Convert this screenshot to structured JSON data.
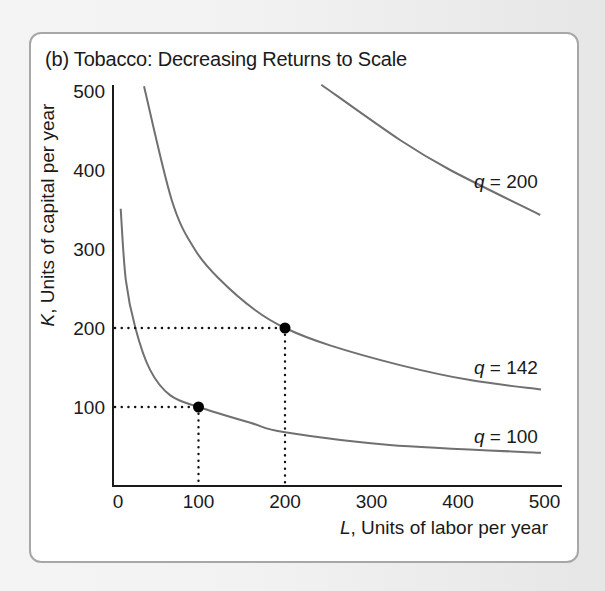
{
  "title": "(b) Tobacco: Decreasing Returns to Scale",
  "axes": {
    "y_label_var": "K",
    "y_label_rest": ", Units of capital per year",
    "x_label_var": "L",
    "x_label_rest": ", Units of labor per year",
    "x_ticks": [
      "0",
      "100",
      "200",
      "300",
      "400",
      "500"
    ],
    "y_ticks": [
      "100",
      "200",
      "300",
      "400",
      "500"
    ]
  },
  "curve_labels": {
    "q200": {
      "var": "q",
      "text": " = 200"
    },
    "q142": {
      "var": "q",
      "text": " = 142"
    },
    "q100": {
      "var": "q",
      "text": " = 100"
    }
  },
  "colors": {
    "curve": "#707070",
    "axis": "#1a1a1a",
    "point": "#000000",
    "card_border": "#a7a7a7"
  },
  "chart_data": {
    "type": "line",
    "title": "(b) Tobacco: Decreasing Returns to Scale",
    "xlabel": "L, Units of labor per year",
    "ylabel": "K, Units of capital per year",
    "xlim": [
      0,
      520
    ],
    "ylim": [
      0,
      510
    ],
    "x_ticks": [
      0,
      100,
      200,
      300,
      400,
      500
    ],
    "y_ticks": [
      100,
      200,
      300,
      400,
      500
    ],
    "grid": false,
    "legend": "inline labels at right end of curves",
    "series": [
      {
        "name": "q = 100",
        "points": [
          [
            10,
            351
          ],
          [
            16,
            261
          ],
          [
            27,
            200
          ],
          [
            44,
            147
          ],
          [
            67,
            115
          ],
          [
            100,
            100
          ],
          [
            160,
            80
          ],
          [
            200,
            68
          ],
          [
            321,
            52
          ],
          [
            496,
            42
          ]
        ]
      },
      {
        "name": "q = 142",
        "points": [
          [
            37,
            506
          ],
          [
            69,
            362
          ],
          [
            96,
            299
          ],
          [
            125,
            261
          ],
          [
            165,
            223
          ],
          [
            200,
            200
          ],
          [
            252,
            178
          ],
          [
            333,
            153
          ],
          [
            414,
            134
          ],
          [
            496,
            122
          ]
        ]
      },
      {
        "name": "q = 200",
        "points": [
          [
            242,
            508
          ],
          [
            333,
            438
          ],
          [
            391,
            400
          ],
          [
            495,
            343
          ]
        ]
      }
    ],
    "highlighted_points": [
      {
        "L": 100,
        "K": 100,
        "on": "q = 100"
      },
      {
        "L": 200,
        "K": 200,
        "on": "q = 142"
      }
    ],
    "reference_lines": "dotted lines from each highlighted point to both axes"
  }
}
